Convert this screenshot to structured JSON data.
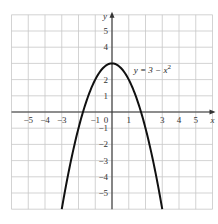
{
  "chart_data": {
    "type": "line",
    "title": "",
    "xlabel": "x",
    "ylabel": "y",
    "xlim": [
      -6,
      6
    ],
    "ylim": [
      -6,
      6
    ],
    "grid": true,
    "x_tick_labels": [
      "−5",
      "−4",
      "−3",
      "−1",
      "0",
      "1",
      "3",
      "4",
      "5"
    ],
    "x_tick_values": [
      -5,
      -4,
      -3,
      -1,
      0,
      1,
      3,
      4,
      5
    ],
    "y_tick_labels": [
      "5",
      "4",
      "2",
      "1",
      "−1",
      "−2",
      "−3",
      "−4",
      "−5"
    ],
    "y_tick_values": [
      5,
      4,
      2,
      1,
      -1,
      -2,
      -3,
      -4,
      -5
    ],
    "series": [
      {
        "name": "y = 3 − x²",
        "function": "3 - x^2",
        "x": [
          -3,
          -2.5,
          -2,
          -1.5,
          -1,
          -0.5,
          0,
          0.5,
          1,
          1.5,
          2,
          2.5,
          3
        ],
        "y": [
          -6,
          -3.25,
          -1,
          0.75,
          2,
          2.75,
          3,
          2.75,
          2,
          0.75,
          -1,
          -3.25,
          -6
        ]
      }
    ],
    "annotations": [
      {
        "text": "y = 3 − x²",
        "x": 1.3,
        "y": 2.4
      }
    ]
  },
  "labels": {
    "x_axis": "x",
    "y_axis": "y",
    "equation_prefix": "y = 3 − x",
    "equation_exponent": "2"
  },
  "colors": {
    "background": "#ffffff",
    "grid": "#c8c8c8",
    "axis": "#333333",
    "curve": "#111111"
  }
}
